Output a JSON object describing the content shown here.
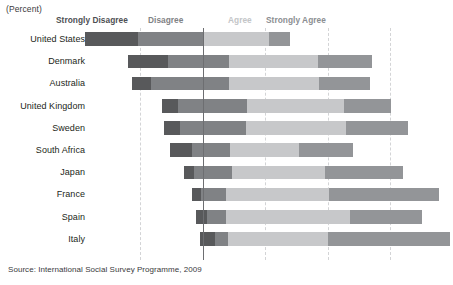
{
  "unit_caption": "(Percent)",
  "source_note": "Source: International Social Survey Programme, 2009",
  "legend": {
    "strongly_disagree": "Strongly Disagree",
    "disagree": "Disagree",
    "agree": "Agree",
    "strongly_agree": "Strongly Agree"
  },
  "colors": {
    "strongly_disagree": "#58595b",
    "disagree": "#808285",
    "agree": "#c7c8ca",
    "strongly_agree": "#939598",
    "zero_line": "#6d6e71",
    "gridline": "#d3d4d6",
    "background": "#ffffff"
  },
  "chart_data": {
    "type": "bar",
    "title": "",
    "subtitle": "",
    "xlabel": "(Percent)",
    "ylabel": "",
    "orientation": "horizontal",
    "stacking": "diverging-stacked",
    "grid": true,
    "legend_position": "top",
    "axis": {
      "zero_at_percent": 0,
      "gridline_values": [
        -20,
        0,
        20,
        40,
        60
      ],
      "xlim": [
        -40,
        80
      ],
      "unit": "percent"
    },
    "categories": [
      "United States",
      "Denmark",
      "Australia",
      "United Kingdom",
      "Sweden",
      "South Africa",
      "Japan",
      "France",
      "Spain",
      "Italy"
    ],
    "series": [
      {
        "name": "Strongly Disagree",
        "color": "#58595b",
        "values": [
          21,
          13,
          6,
          5,
          5,
          7,
          3,
          3,
          4,
          5
        ]
      },
      {
        "name": "Disagree",
        "color": "#808285",
        "values": [
          17,
          20,
          25,
          22,
          21,
          12,
          12,
          8,
          6,
          4
        ]
      },
      {
        "name": "Agree",
        "color": "#c7c8ca",
        "values": [
          22,
          29,
          29,
          31,
          32,
          22,
          30,
          33,
          39,
          32
        ]
      },
      {
        "name": "Strongly Agree",
        "color": "#939598",
        "values": [
          7,
          17,
          16,
          15,
          20,
          17,
          25,
          35,
          23,
          39
        ]
      }
    ]
  },
  "bars": [
    {
      "label": "United States",
      "segments": [
        {
          "name": "strongly-disagree",
          "class": "seg-sd",
          "width_px": 53.0
        },
        {
          "name": "disagree",
          "class": "seg-d",
          "width_px": 65.0
        },
        {
          "name": "agree",
          "class": "seg-a",
          "width_px": 66.0
        },
        {
          "name": "strongly-agree",
          "class": "seg-sa",
          "width_px": 21.0
        }
      ],
      "left_px": 85.0
    },
    {
      "label": "Denmark",
      "segments": [
        {
          "name": "strongly-disagree",
          "class": "seg-sd",
          "width_px": 40.0
        },
        {
          "name": "disagree",
          "class": "seg-d",
          "width_px": 61.0
        },
        {
          "name": "agree",
          "class": "seg-a",
          "width_px": 89.0
        },
        {
          "name": "strongly-agree",
          "class": "seg-sa",
          "width_px": 54.0
        }
      ],
      "left_px": 128.0
    },
    {
      "label": "Australia",
      "segments": [
        {
          "name": "strongly-disagree",
          "class": "seg-sd",
          "width_px": 19.0
        },
        {
          "name": "disagree",
          "class": "seg-d",
          "width_px": 78.0
        },
        {
          "name": "agree",
          "class": "seg-a",
          "width_px": 90.0
        },
        {
          "name": "strongly-agree",
          "class": "seg-sa",
          "width_px": 51.0
        }
      ],
      "left_px": 132.0
    },
    {
      "label": "United Kingdom",
      "segments": [
        {
          "name": "strongly-disagree",
          "class": "seg-sd",
          "width_px": 16.0
        },
        {
          "name": "disagree",
          "class": "seg-d",
          "width_px": 69.0
        },
        {
          "name": "agree",
          "class": "seg-a",
          "width_px": 97.0
        },
        {
          "name": "strongly-agree",
          "class": "seg-sa",
          "width_px": 47.0
        }
      ],
      "left_px": 162.0
    },
    {
      "label": "Sweden",
      "segments": [
        {
          "name": "strongly-disagree",
          "class": "seg-sd",
          "width_px": 16.0
        },
        {
          "name": "disagree",
          "class": "seg-d",
          "width_px": 66.0
        },
        {
          "name": "agree",
          "class": "seg-a",
          "width_px": 100.0
        },
        {
          "name": "strongly-agree",
          "class": "seg-sa",
          "width_px": 62.0
        }
      ],
      "left_px": 164.0
    },
    {
      "label": "South Africa",
      "segments": [
        {
          "name": "strongly-disagree",
          "class": "seg-sd",
          "width_px": 22.0
        },
        {
          "name": "disagree",
          "class": "seg-d",
          "width_px": 38.0
        },
        {
          "name": "agree",
          "class": "seg-a",
          "width_px": 69.0
        },
        {
          "name": "strongly-agree",
          "class": "seg-sa",
          "width_px": 54.0
        }
      ],
      "left_px": 170.0
    },
    {
      "label": "Japan",
      "segments": [
        {
          "name": "strongly-disagree",
          "class": "seg-sd",
          "width_px": 10.0
        },
        {
          "name": "disagree",
          "class": "seg-d",
          "width_px": 38.0
        },
        {
          "name": "agree",
          "class": "seg-a",
          "width_px": 93.0
        },
        {
          "name": "strongly-agree",
          "class": "seg-sa",
          "width_px": 78.0
        }
      ],
      "left_px": 184.0
    },
    {
      "label": "France",
      "segments": [
        {
          "name": "strongly-disagree",
          "class": "seg-sd",
          "width_px": 9.0
        },
        {
          "name": "disagree",
          "class": "seg-d",
          "width_px": 25.0
        },
        {
          "name": "agree",
          "class": "seg-a",
          "width_px": 103.0
        },
        {
          "name": "strongly-agree",
          "class": "seg-sa",
          "width_px": 110.0
        }
      ],
      "left_px": 192.0
    },
    {
      "label": "Spain",
      "segments": [
        {
          "name": "strongly-disagree",
          "class": "seg-sd",
          "width_px": 11.0
        },
        {
          "name": "disagree",
          "class": "seg-d",
          "width_px": 19.0
        },
        {
          "name": "agree",
          "class": "seg-a",
          "width_px": 124.0
        },
        {
          "name": "strongly-agree",
          "class": "seg-sa",
          "width_px": 72.0
        }
      ],
      "left_px": 196.0
    },
    {
      "label": "Italy",
      "segments": [
        {
          "name": "strongly-disagree",
          "class": "seg-sd",
          "width_px": 15.0
        },
        {
          "name": "disagree",
          "class": "seg-d",
          "width_px": 13.0
        },
        {
          "name": "agree",
          "class": "seg-a",
          "width_px": 100.0
        },
        {
          "name": "strongly-agree",
          "class": "seg-sa",
          "width_px": 122.0
        }
      ],
      "left_px": 200.0
    }
  ],
  "gridlines_px": [
    140,
    265,
    328,
    390
  ]
}
